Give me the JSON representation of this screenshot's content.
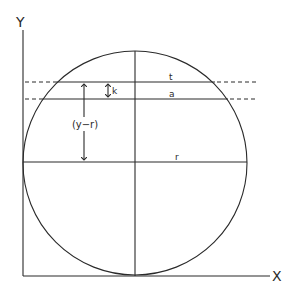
{
  "axes": {
    "y_label": "Y",
    "x_label": "X"
  },
  "labels": {
    "upper_chord": "t",
    "lower_chord": "a",
    "gap": "k",
    "height_from_center": "(y−r)",
    "radius": "r"
  }
}
